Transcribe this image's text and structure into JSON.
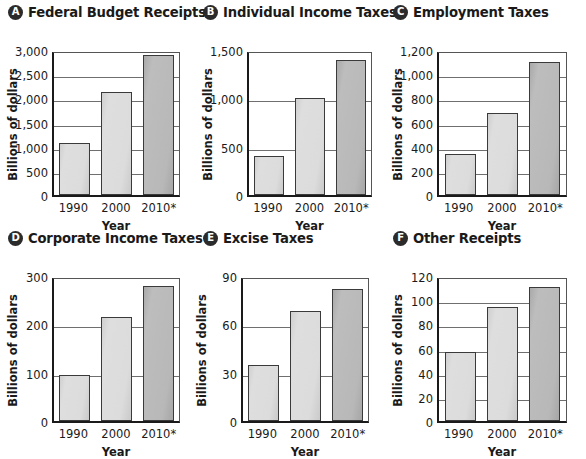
{
  "figure": {
    "ylabel": "Billions of dollars",
    "xlabel": "Year",
    "categories": [
      "1990",
      "2000",
      "2010*"
    ],
    "bar_colors": {
      "light": "#dcdcdc",
      "dark": "#b8b8b8",
      "outline": "#3a3a3a"
    }
  },
  "panels": [
    {
      "badge": "A",
      "title": "Federal Budget Receipts",
      "ylabel": "Billions of dollars",
      "xlabel": "Year",
      "yticks": [
        "0",
        "500",
        "1,000",
        "1,500",
        "2,000",
        "2,500",
        "3,000"
      ]
    },
    {
      "badge": "B",
      "title": "Individual Income Taxes",
      "ylabel": "Billions of dollars",
      "xlabel": "Year",
      "yticks": [
        "0",
        "500",
        "1,000",
        "1,500"
      ]
    },
    {
      "badge": "C",
      "title": "Employment Taxes",
      "ylabel": "Billions of dollars",
      "xlabel": "Year",
      "yticks": [
        "0",
        "200",
        "400",
        "600",
        "800",
        "1,000",
        "1,200"
      ]
    },
    {
      "badge": "D",
      "title": "Corporate Income Taxes",
      "ylabel": "Billions of dollars",
      "xlabel": "Year",
      "yticks": [
        "0",
        "100",
        "200",
        "300"
      ]
    },
    {
      "badge": "E",
      "title": "Excise Taxes",
      "ylabel": "Billions of dollars",
      "xlabel": "Year",
      "yticks": [
        "0",
        "30",
        "60",
        "90"
      ]
    },
    {
      "badge": "F",
      "title": "Other Receipts",
      "ylabel": "Billions of dollars",
      "xlabel": "Year",
      "yticks": [
        "0",
        "20",
        "40",
        "60",
        "80",
        "100",
        "120"
      ]
    }
  ],
  "chart_data": [
    {
      "type": "bar",
      "panel": "A",
      "title": "Federal Budget Receipts",
      "categories": [
        "1990",
        "2000",
        "2010*"
      ],
      "values": [
        1080,
        2130,
        2900
      ],
      "xlabel": "Year",
      "ylabel": "Billions of dollars",
      "ylim": [
        0,
        3000
      ],
      "ytick_values": [
        0,
        500,
        1000,
        1500,
        2000,
        2500,
        3000
      ],
      "grid": true,
      "legend": "none"
    },
    {
      "type": "bar",
      "panel": "B",
      "title": "Individual Income Taxes",
      "categories": [
        "1990",
        "2000",
        "2010*"
      ],
      "values": [
        400,
        1000,
        1400
      ],
      "xlabel": "Year",
      "ylabel": "Billions of dollars",
      "ylim": [
        0,
        1500
      ],
      "ytick_values": [
        0,
        500,
        1000,
        1500
      ],
      "grid": true,
      "legend": "none"
    },
    {
      "type": "bar",
      "panel": "C",
      "title": "Employment Taxes",
      "categories": [
        "1990",
        "2000",
        "2010*"
      ],
      "values": [
        340,
        680,
        1100
      ],
      "xlabel": "Year",
      "ylabel": "Billions of dollars",
      "ylim": [
        0,
        1200
      ],
      "ytick_values": [
        0,
        200,
        400,
        600,
        800,
        1000,
        1200
      ],
      "grid": true,
      "legend": "none"
    },
    {
      "type": "bar",
      "panel": "D",
      "title": "Corporate Income Taxes",
      "categories": [
        "1990",
        "2000",
        "2010*"
      ],
      "values": [
        95,
        215,
        280
      ],
      "xlabel": "Year",
      "ylabel": "Billions of dollars",
      "ylim": [
        0,
        300
      ],
      "ytick_values": [
        0,
        100,
        200,
        300
      ],
      "grid": true,
      "legend": "none"
    },
    {
      "type": "bar",
      "panel": "E",
      "title": "Excise Taxes",
      "categories": [
        "1990",
        "2000",
        "2010*"
      ],
      "values": [
        35,
        68,
        82
      ],
      "xlabel": "Year",
      "ylabel": "Billions of dollars",
      "ylim": [
        0,
        90
      ],
      "ytick_values": [
        0,
        30,
        60,
        90
      ],
      "grid": true,
      "legend": "none"
    },
    {
      "type": "bar",
      "panel": "F",
      "title": "Other Receipts",
      "categories": [
        "1990",
        "2000",
        "2010*"
      ],
      "values": [
        57,
        94,
        111
      ],
      "xlabel": "Year",
      "ylabel": "Billions of dollars",
      "ylim": [
        0,
        120
      ],
      "ytick_values": [
        0,
        20,
        40,
        60,
        80,
        100,
        120
      ],
      "grid": true,
      "legend": "none"
    }
  ]
}
